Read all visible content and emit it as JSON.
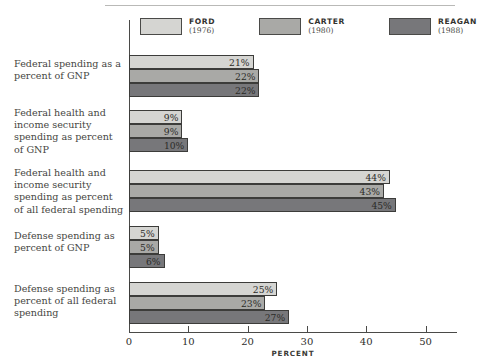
{
  "chart_data": {
    "type": "bar",
    "orientation": "horizontal",
    "title": "",
    "xlabel": "PERCENT",
    "ylabel": "",
    "xlim": [
      0,
      50
    ],
    "xticks": [
      0,
      10,
      20,
      30,
      40,
      50
    ],
    "grid": false,
    "legend_position": "top",
    "value_suffix": "%",
    "categories": [
      "Federal spending as a percent of GNP",
      "Federal health and income security spending as percent of GNP",
      "Federal health and income security spending as percent of all federal spending",
      "Defense spending as percent of GNP",
      "Defense spending as percent of all federal spending"
    ],
    "series": [
      {
        "name": "FORD",
        "year": "(1976)",
        "color": "#d5d5d2",
        "values": [
          21,
          9,
          44,
          5,
          25
        ]
      },
      {
        "name": "CARTER",
        "year": "(1980)",
        "color": "#a9a9a6",
        "values": [
          22,
          9,
          43,
          5,
          23
        ]
      },
      {
        "name": "REAGAN",
        "year": "(1988)",
        "color": "#77777a",
        "values": [
          22,
          10,
          45,
          6,
          27
        ]
      }
    ],
    "value_labels": [
      [
        "21%",
        "22%",
        "22%"
      ],
      [
        "9%",
        "9%",
        "10%"
      ],
      [
        "44%",
        "43%",
        "45%"
      ],
      [
        "5%",
        "5%",
        "6%"
      ],
      [
        "25%",
        "23%",
        "27%"
      ]
    ],
    "tick_labels": [
      "0",
      "10",
      "20",
      "30",
      "40",
      "50"
    ]
  },
  "legend": {
    "items": [
      {
        "name": "FORD",
        "year": "(1976)"
      },
      {
        "name": "CARTER",
        "year": "(1980)"
      },
      {
        "name": "REAGAN",
        "year": "(1988)"
      }
    ]
  },
  "axis": {
    "x_title": "PERCENT"
  },
  "colors": {
    "ford": "#d5d5d2",
    "carter": "#a9a9a6",
    "reagan": "#77777a",
    "axis": "#4a4a48",
    "text": "#46463f",
    "background": "#ffffff"
  }
}
